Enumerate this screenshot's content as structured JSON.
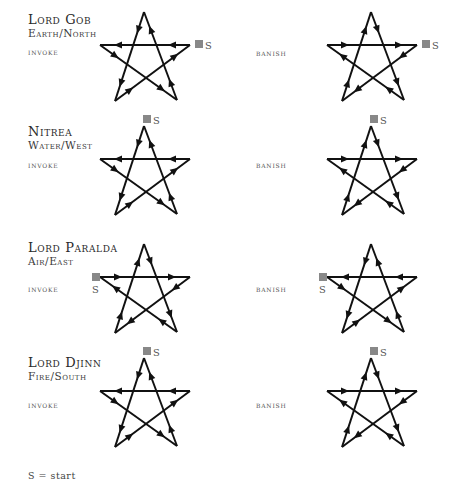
{
  "diagram": {
    "rows": [
      {
        "title": "Lord Gob",
        "element": "Earth/North",
        "invoke_label": "invoke",
        "banish_label": "banish",
        "invoke_start": "right",
        "banish_start": "right"
      },
      {
        "title": "Nitrea",
        "element": "Water/West",
        "invoke_label": "invoke",
        "banish_label": "banish",
        "invoke_start": "top",
        "banish_start": "top"
      },
      {
        "title": "Lord Paralda",
        "element": "Air/East",
        "invoke_label": "invoke",
        "banish_label": "banish",
        "invoke_start": "left",
        "banish_start": "left"
      },
      {
        "title": "Lord Djinn",
        "element": "Fire/South",
        "invoke_label": "invoke",
        "banish_label": "banish",
        "invoke_start": "top",
        "banish_start": "top"
      }
    ],
    "start_marker": "S",
    "legend": "S = start",
    "colors": {
      "line": "#111111",
      "marker": "#888888",
      "text": "#333333"
    }
  }
}
